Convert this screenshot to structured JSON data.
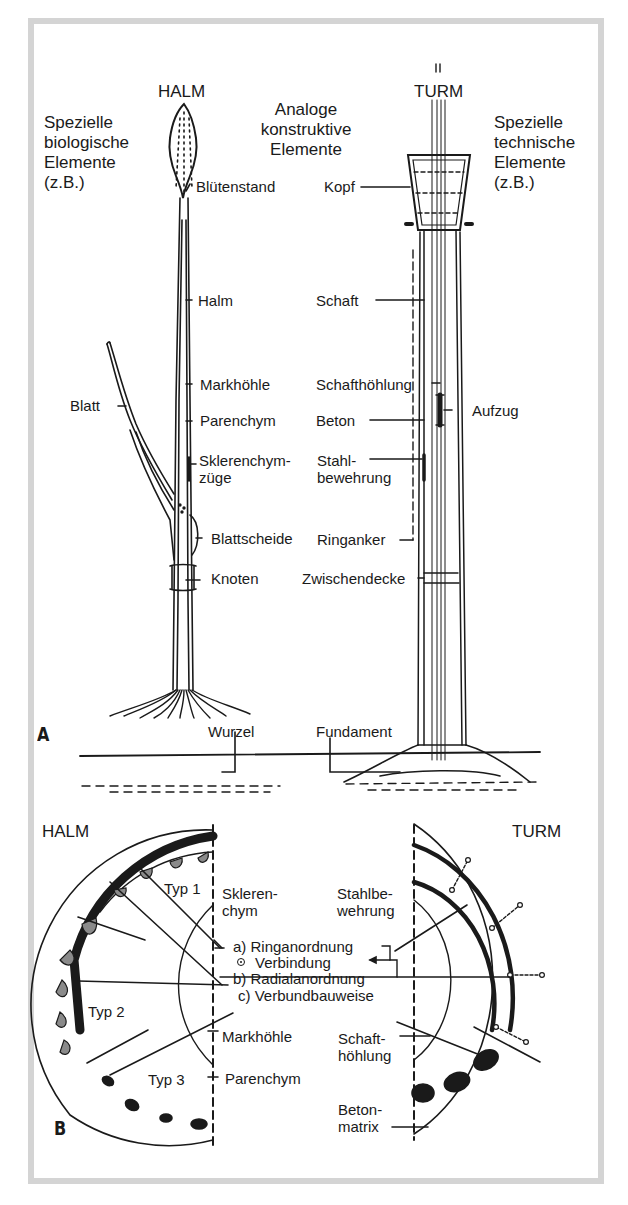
{
  "panel_a": {
    "letter": "A",
    "headers": {
      "left_title": "HALM",
      "right_title": "TURM",
      "left_caption": "Spezielle\nbiologische\nElemente\n(z.B.)",
      "center_caption": "Analoge\nkonstruktive\nElemente",
      "right_caption": "Spezielle\ntechnische\nElemente\n(z.B.)"
    },
    "halm_labels": {
      "bluetenstand": "Blütenstand",
      "halm": "Halm",
      "markhoehle": "Markhöhle",
      "parenchym": "Parenchym",
      "sklerenchym": "Sklerenchym-\nzüge",
      "blattscheide": "Blattscheide",
      "knoten": "Knoten",
      "blatt": "Blatt",
      "wurzel": "Wurzel"
    },
    "turm_labels": {
      "kopf": "Kopf",
      "schaft": "Schaft",
      "schafthoehlung": "Schafthöhlung",
      "beton": "Beton",
      "stahlbewehrung": "Stahl-\nbewehrung",
      "ringanker": "Ringanker",
      "zwischendecke": "Zwischendecke",
      "aufzug": "Aufzug",
      "fundament": "Fundament"
    }
  },
  "panel_b": {
    "letter": "B",
    "left_title": "HALM",
    "right_title": "TURM",
    "halm_labels": {
      "typ1": "Typ 1",
      "typ2": "Typ 2",
      "typ3": "Typ 3",
      "sklerenchym": "Skleren-\nchym",
      "markhoehle": "Markhöhle",
      "parenchym": "Parenchym"
    },
    "principles": {
      "a": "a) Ringanordnung",
      "connection": "Verbindung",
      "b": "b) Radialanordnung",
      "c": "c) Verbundbauweise"
    },
    "turm_labels": {
      "stahlbewehrung": "Stahlbe-\nwehrung",
      "schafthoehlung": "Schaft-\nhöhlung",
      "betonmatrix": "Beton-\nmatrix"
    }
  },
  "colors": {
    "frame_border": "#d4d4d4",
    "ink": "#1a1a1a",
    "background": "#ffffff"
  }
}
